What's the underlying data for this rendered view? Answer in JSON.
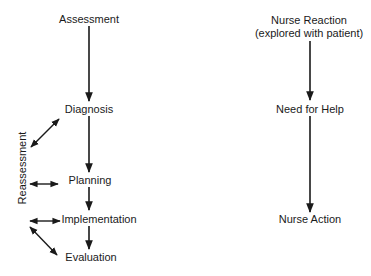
{
  "left_flow": {
    "assessment": "Assessment",
    "diagnosis": "Diagnosis",
    "planning": "Planning",
    "implementation": "Implementation",
    "evaluation": "Evaluation",
    "reassessment": "Reassessment"
  },
  "right_flow": {
    "nurse_reaction": "Nurse Reaction",
    "nurse_reaction_note": "(explored with patient)",
    "need_for_help": "Need for Help",
    "nurse_action": "Nurse Action"
  },
  "colors": {
    "ink": "#1a1a1a",
    "background": "#ffffff"
  }
}
